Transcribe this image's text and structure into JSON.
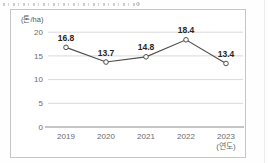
{
  "page": {
    "background": "#fefefe",
    "top_caption_clipped": true
  },
  "chart_data": {
    "type": "line",
    "title": "",
    "categories": [
      "2019",
      "2020",
      "2021",
      "2022",
      "2023"
    ],
    "values": [
      16.8,
      13.7,
      14.8,
      18.4,
      13.4
    ],
    "value_labels": [
      "16.8",
      "13.7",
      "14.8",
      "18.4",
      "13.4"
    ],
    "ylabel": "(톤/ha)",
    "xlabel": "(연도)",
    "yticks": [
      0,
      5,
      10,
      15,
      20
    ],
    "ylim": [
      0,
      20
    ],
    "grid": "horizontal",
    "legend": "none",
    "marker": "open-circle",
    "colors": {
      "line": "#4d4d4d",
      "marker_fill": "#ffffff",
      "marker_stroke": "#4d4d4d",
      "grid": "#d9d9d9",
      "axis": "#8c8c8c",
      "tick_text": "#6b6b6b",
      "value_text": "#262626",
      "unit_text": "#555555",
      "panel_border": "#c5c5c5"
    }
  }
}
